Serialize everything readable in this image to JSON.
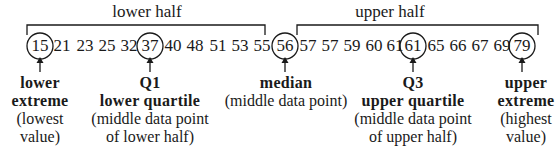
{
  "brackets": {
    "lower": {
      "label": "lower half"
    },
    "upper": {
      "label": "upper half"
    }
  },
  "data_values": [
    "15",
    "21",
    "23",
    "25",
    "32",
    "37",
    "40",
    "48",
    "51",
    "53",
    "55",
    "56",
    "57",
    "57",
    "59",
    "60",
    "61",
    "61",
    "65",
    "66",
    "67",
    "69",
    "79"
  ],
  "highlighted": {
    "lower_extreme": "15",
    "q1": "37",
    "median": "56",
    "q3": "61",
    "upper_extreme": "79"
  },
  "labels": {
    "lower_extreme": {
      "title1": "lower",
      "title2": "extreme",
      "desc1": "(lowest",
      "desc2": "value)"
    },
    "q1": {
      "title1": "Q1",
      "title2": "lower quartile",
      "desc1": "(middle data point",
      "desc2": "of lower half)"
    },
    "median": {
      "title1": "median",
      "desc1": "(middle data point)"
    },
    "q3": {
      "title1": "Q3",
      "title2": "upper quartile",
      "desc1": "(middle data point",
      "desc2": "of upper half)"
    },
    "upper_extreme": {
      "title1": "upper",
      "title2": "extreme",
      "desc1": "(highest",
      "desc2": "value)"
    }
  },
  "colors": {
    "ink": "#1a1a1a",
    "background": "#ffffff"
  }
}
